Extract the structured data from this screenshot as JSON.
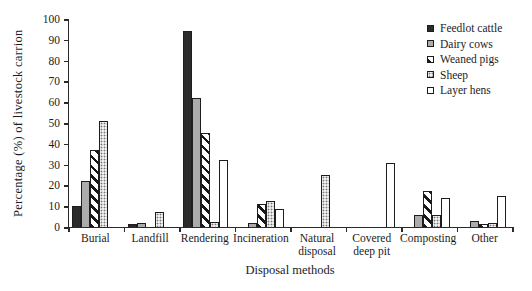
{
  "chart_data": {
    "type": "bar",
    "title": "",
    "xlabel": "Disposal methods",
    "ylabel": "Percentage (%) of livestock carrion",
    "ylim": [
      0,
      100
    ],
    "ytick_step": 10,
    "grid": false,
    "legend_position": "top-right",
    "categories": [
      "Burial",
      "Landfill",
      "Rendering",
      "Incineration",
      "Natural disposal",
      "Covered deep pit",
      "Composting",
      "Other"
    ],
    "series": [
      {
        "name": "Feedlot cattle",
        "pattern": "solid-black",
        "values": [
          10,
          1.5,
          94,
          0,
          0,
          0,
          0,
          0
        ]
      },
      {
        "name": "Dairy cows",
        "pattern": "solid-gray",
        "values": [
          22,
          2,
          62,
          2,
          0,
          0,
          6,
          3
        ]
      },
      {
        "name": "Weaned pigs",
        "pattern": "diagonal",
        "values": [
          37,
          0,
          45,
          11,
          0,
          0,
          17.5,
          1.5
        ]
      },
      {
        "name": "Sheep",
        "pattern": "dots",
        "values": [
          51,
          7,
          2.5,
          12.5,
          25,
          0,
          6,
          2
        ]
      },
      {
        "name": "Layer hens",
        "pattern": "white",
        "values": [
          0,
          0,
          32,
          8.5,
          0,
          31,
          14,
          15
        ]
      }
    ],
    "colors": {
      "bar_black": "#2b2b2b",
      "bar_gray": "#ababab",
      "pattern_ink": "#181818",
      "bar_white": "#ffffff",
      "axis": "#2a2a2a",
      "text": "#1c1c1c",
      "background": "#ffffff"
    }
  }
}
